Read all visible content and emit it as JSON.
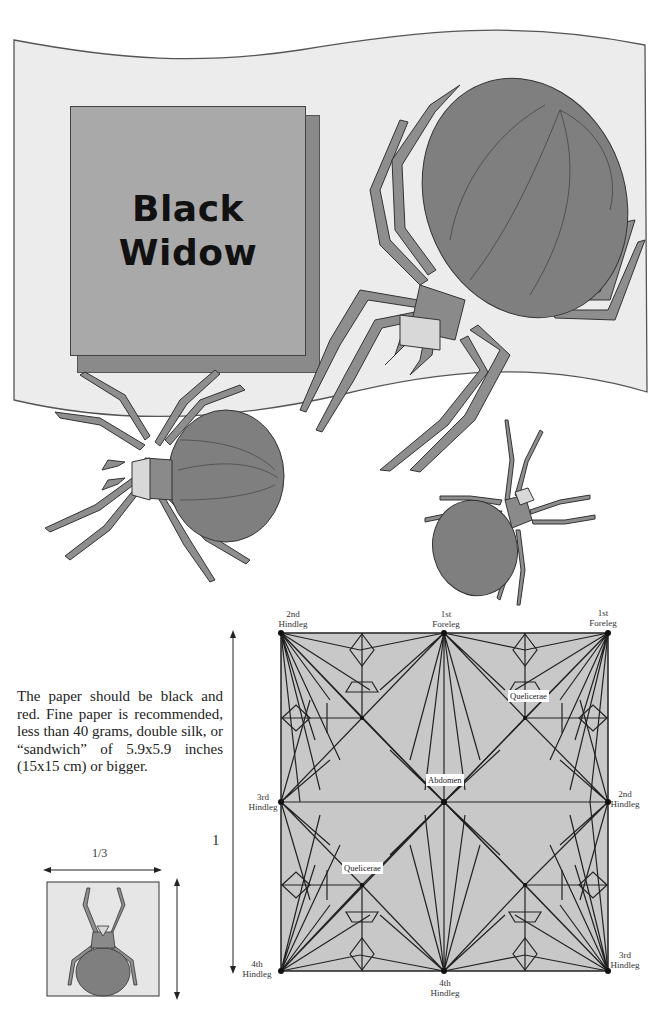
{
  "title": {
    "line1": "Black",
    "line2": "Widow"
  },
  "description": "The paper should be black and red. Fine paper is recommended, less than 40 grams, double silk, or “sandwich” of 5.9x5.9 inches (15x15 cm) or bigger.",
  "crease_pattern": {
    "labels": {
      "top_left": [
        "2nd",
        "Hindleg"
      ],
      "top_center": [
        "1st",
        "Foreleg"
      ],
      "top_right": [
        "1st",
        "Foreleg"
      ],
      "mid_left": [
        "3rd",
        "Hindleg"
      ],
      "mid_right": [
        "2nd",
        "Hindleg"
      ],
      "bottom_left": [
        "4th",
        "Hindleg"
      ],
      "bottom_center": [
        "4th",
        "Hindleg"
      ],
      "bottom_right": [
        "3rd",
        "Hindleg"
      ]
    },
    "tags": {
      "abdomen": "Abdomen",
      "quelicerae_top": "Quelicerae",
      "quelicerae_bottom": "Quelicerae"
    },
    "side_length_label": "1"
  },
  "paper_size": {
    "width_label": "1/3"
  },
  "colors": {
    "flag": "#ececec",
    "card": "#a9a9a9",
    "spider": "#7f7f7f",
    "leg": "#8e8e8e",
    "crease_bg": "#c8c8c8"
  }
}
